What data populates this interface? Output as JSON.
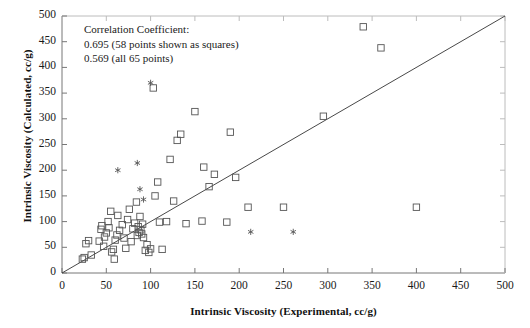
{
  "figure": {
    "x_axis_title": "Intrinsic Viscosity (Experimental, cc/g)",
    "y_axis_title": "Intrinsic Viscosity (Calculated, cc/g)",
    "annotation_lines": [
      "Correlation Coefficient:",
      "0.695 (58 points shown as squares)",
      "0.569 (all 65 points)"
    ],
    "marker_color": "#555555",
    "line_color": "#333333",
    "axis_color": "#777777"
  },
  "chart_data": {
    "type": "scatter",
    "title": "",
    "xlabel": "Intrinsic Viscosity (Experimental, cc/g)",
    "ylabel": "Intrinsic Viscosity (Calculated, cc/g)",
    "xlim": [
      0,
      500
    ],
    "ylim": [
      0,
      500
    ],
    "xticks": [
      0,
      50,
      100,
      150,
      200,
      250,
      300,
      350,
      400,
      450,
      500
    ],
    "yticks": [
      0,
      50,
      100,
      150,
      200,
      250,
      300,
      350,
      400,
      450,
      500
    ],
    "grid": false,
    "legend": null,
    "annotations": [
      "Correlation Coefficient:",
      "0.695 (58 points shown as squares)",
      "0.569 (all 65 points)"
    ],
    "reference_line": {
      "name": "y = x parity line",
      "x": [
        0,
        500
      ],
      "y": [
        0,
        500
      ]
    },
    "series": [
      {
        "name": "0.695 (58 points shown as squares)",
        "marker": "square-open",
        "points": [
          [
            23,
            27
          ],
          [
            25,
            30
          ],
          [
            27,
            57
          ],
          [
            30,
            63
          ],
          [
            33,
            35
          ],
          [
            42,
            62
          ],
          [
            44,
            85
          ],
          [
            45,
            92
          ],
          [
            47,
            52
          ],
          [
            48,
            70
          ],
          [
            50,
            78
          ],
          [
            52,
            100
          ],
          [
            53,
            88
          ],
          [
            55,
            120
          ],
          [
            56,
            41
          ],
          [
            58,
            46
          ],
          [
            59,
            27
          ],
          [
            60,
            64
          ],
          [
            62,
            74
          ],
          [
            63,
            112
          ],
          [
            65,
            83
          ],
          [
            68,
            94
          ],
          [
            70,
            68
          ],
          [
            72,
            48
          ],
          [
            74,
            104
          ],
          [
            76,
            124
          ],
          [
            78,
            61
          ],
          [
            80,
            86
          ],
          [
            82,
            97
          ],
          [
            84,
            138
          ],
          [
            85,
            73
          ],
          [
            86,
            90
          ],
          [
            87,
            79
          ],
          [
            88,
            110
          ],
          [
            89,
            84
          ],
          [
            90,
            76
          ],
          [
            91,
            95
          ],
          [
            92,
            69
          ],
          [
            94,
            44
          ],
          [
            96,
            55
          ],
          [
            98,
            40
          ],
          [
            100,
            47
          ],
          [
            103,
            360
          ],
          [
            105,
            150
          ],
          [
            108,
            177
          ],
          [
            110,
            99
          ],
          [
            113,
            46
          ],
          [
            118,
            100
          ],
          [
            122,
            221
          ],
          [
            126,
            140
          ],
          [
            130,
            258
          ],
          [
            134,
            270
          ],
          [
            140,
            96
          ],
          [
            150,
            314
          ],
          [
            158,
            101
          ],
          [
            160,
            206
          ],
          [
            166,
            168
          ],
          [
            172,
            192
          ],
          [
            186,
            99
          ],
          [
            190,
            274
          ],
          [
            196,
            186
          ],
          [
            210,
            128
          ],
          [
            250,
            128
          ],
          [
            295,
            305
          ],
          [
            340,
            479
          ],
          [
            360,
            438
          ],
          [
            400,
            128
          ]
        ]
      },
      {
        "name": "additional points shown as asterisks",
        "marker": "asterisk",
        "points": [
          [
            63,
            200
          ],
          [
            85,
            214
          ],
          [
            88,
            163
          ],
          [
            92,
            143
          ],
          [
            100,
            370
          ],
          [
            213,
            80
          ],
          [
            261,
            80
          ]
        ]
      }
    ]
  }
}
